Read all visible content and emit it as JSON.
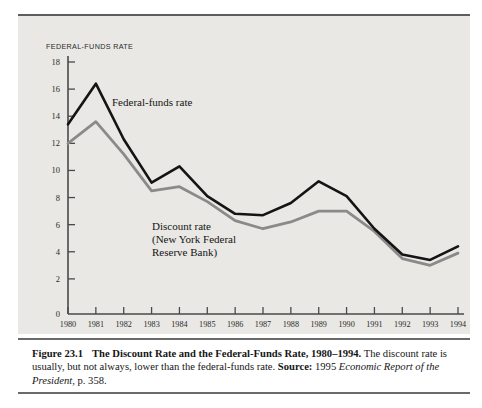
{
  "figure": {
    "axis_title": "FEDERAL-FUNDS RATE",
    "series_label_federal": "Federal-funds rate",
    "series_label_discount_line1": "Discount rate",
    "series_label_discount_line2": "(New York Federal",
    "series_label_discount_line3": "Reserve Bank)"
  },
  "caption": {
    "figure_number": "Figure 23.1",
    "title": "The Discount Rate and the Federal-Funds Rate, 1980–1994.",
    "body": " The discount rate is usually, but not always, lower than the federal-funds rate. ",
    "source_label": "Source:",
    "source_year": " 1995 ",
    "source_publication": "Economic Report of the President",
    "source_page": ", p. 358."
  },
  "colors": {
    "federal_funds_line": "#141414",
    "discount_line": "#8a8a8a",
    "panel_background": "#e9e8e4",
    "axis": "#4a4a4a",
    "rule": "#6a6a6a"
  },
  "chart_data": {
    "type": "line",
    "xlabel": "",
    "ylabel": "FEDERAL-FUNDS RATE",
    "x": [
      1980,
      1981,
      1982,
      1983,
      1984,
      1985,
      1986,
      1987,
      1988,
      1989,
      1990,
      1991,
      1992,
      1993,
      1994
    ],
    "xlim": [
      1980,
      1994
    ],
    "ylim": [
      0,
      18
    ],
    "yticks": [
      2,
      4,
      6,
      8,
      10,
      12,
      14,
      16,
      18
    ],
    "xticks": [
      "1980",
      "1981",
      "1982",
      "1983",
      "1984",
      "1985",
      "1986",
      "1987",
      "1988",
      "1989",
      "1990",
      "1991",
      "1992",
      "1993",
      "1994"
    ],
    "grid": false,
    "legend": "inline-annotations",
    "series": [
      {
        "name": "Federal-funds rate",
        "color": "#141414",
        "values": [
          13.4,
          16.4,
          12.3,
          9.1,
          10.3,
          8.1,
          6.8,
          6.7,
          7.6,
          9.2,
          8.1,
          5.7,
          3.8,
          3.4,
          4.4
        ]
      },
      {
        "name": "Discount rate (New York Federal Reserve Bank)",
        "color": "#8a8a8a",
        "values": [
          12.0,
          13.6,
          11.2,
          8.5,
          8.8,
          7.7,
          6.3,
          5.7,
          6.2,
          7.0,
          7.0,
          5.5,
          3.5,
          3.0,
          3.9
        ]
      }
    ]
  }
}
